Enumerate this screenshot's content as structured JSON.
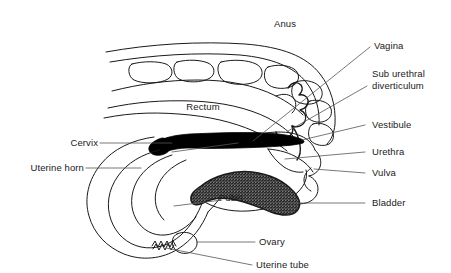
{
  "figure": {
    "type": "anatomical-line-diagram",
    "background_color": "#ffffff",
    "line_color": "#1a1a1a",
    "text_color": "#1a1a1a",
    "fill_black": "#000000",
    "fill_stipple": "#d9d9d9",
    "width": 451,
    "height": 273
  },
  "labels": {
    "anus": "Anus",
    "vagina": "Vagina",
    "sub_urethral_diverticulum_line1": "Sub urethral",
    "sub_urethral_diverticulum_line2": "diverticulum",
    "vestibule": "Vestibule",
    "urethra": "Urethra",
    "vulva": "Vulva",
    "bladder": "Bladder",
    "rectum": "Rectum",
    "cervix": "Cervix",
    "uterine_horn": "Uterine horn",
    "pubis": "Pubis",
    "ovary": "Ovary",
    "uterine_tube": "Uterine tube"
  },
  "structures": [
    {
      "name": "anus",
      "label": "Anus",
      "fill": "none",
      "side": "top"
    },
    {
      "name": "vagina",
      "label": "Vagina",
      "fill": "#000000",
      "side": "right"
    },
    {
      "name": "sub-urethral-diverticulum",
      "label": "Sub urethral diverticulum",
      "fill": "none",
      "side": "right"
    },
    {
      "name": "vestibule",
      "label": "Vestibule",
      "fill": "none",
      "side": "right"
    },
    {
      "name": "urethra",
      "label": "Urethra",
      "fill": "none",
      "side": "right"
    },
    {
      "name": "vulva",
      "label": "Vulva",
      "fill": "none",
      "side": "right"
    },
    {
      "name": "bladder",
      "label": "Bladder",
      "fill": "none",
      "side": "right"
    },
    {
      "name": "rectum",
      "label": "Rectum",
      "fill": "none",
      "side": "inline"
    },
    {
      "name": "cervix",
      "label": "Cervix",
      "fill": "none",
      "side": "left"
    },
    {
      "name": "uterine-horn",
      "label": "Uterine horn",
      "fill": "none",
      "side": "left"
    },
    {
      "name": "pubis",
      "label": "Pubis",
      "fill": "#d9d9d9",
      "side": "inline"
    },
    {
      "name": "ovary",
      "label": "Ovary",
      "fill": "none",
      "side": "right"
    },
    {
      "name": "uterine-tube",
      "label": "Uterine tube",
      "fill": "none",
      "side": "right"
    }
  ]
}
